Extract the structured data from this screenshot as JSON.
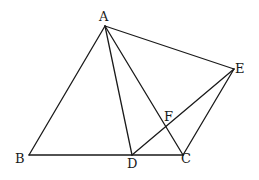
{
  "diagram": {
    "type": "geometry",
    "points": {
      "A": {
        "x": 105,
        "y": 26
      },
      "B": {
        "x": 29,
        "y": 155
      },
      "C": {
        "x": 183,
        "y": 155
      },
      "D": {
        "x": 132,
        "y": 155
      },
      "E": {
        "x": 234,
        "y": 69
      },
      "F": {
        "x": 166,
        "y": 127
      }
    },
    "segments": [
      [
        "A",
        "B"
      ],
      [
        "B",
        "C"
      ],
      [
        "A",
        "C"
      ],
      [
        "A",
        "D"
      ],
      [
        "A",
        "E"
      ],
      [
        "E",
        "C"
      ],
      [
        "D",
        "E"
      ]
    ],
    "labels": {
      "A": {
        "text": "A",
        "x": 99,
        "y": 21
      },
      "B": {
        "text": "B",
        "x": 15,
        "y": 163
      },
      "C": {
        "text": "C",
        "x": 181,
        "y": 163
      },
      "D": {
        "text": "D",
        "x": 127,
        "y": 168
      },
      "E": {
        "text": "E",
        "x": 235,
        "y": 73
      },
      "F": {
        "text": "F",
        "x": 164,
        "y": 121
      }
    },
    "stroke_color": "#1a1a1a",
    "background": "#ffffff"
  }
}
